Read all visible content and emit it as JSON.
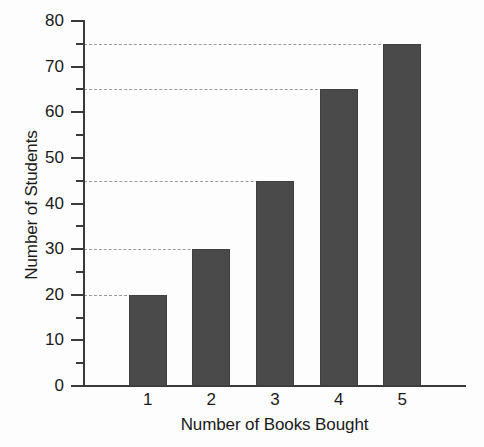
{
  "chart_data": {
    "type": "bar",
    "title": "",
    "xlabel": "Number of Books Bought",
    "ylabel": "Number of Students",
    "categories": [
      "1",
      "2",
      "3",
      "4",
      "5"
    ],
    "values": [
      20,
      30,
      45,
      65,
      75
    ],
    "ylim": [
      0,
      80
    ],
    "xlim": [
      0,
      6
    ],
    "y_major_ticks": [
      0,
      10,
      20,
      30,
      40,
      50,
      60,
      70,
      80
    ],
    "y_minor_ticks": [
      5,
      15,
      25,
      35,
      45,
      55,
      65,
      75
    ],
    "y_tick_labels": [
      "0",
      "10",
      "20",
      "30",
      "40",
      "50",
      "60",
      "70",
      "80"
    ],
    "gridlines": [
      20,
      30,
      45,
      65,
      75
    ],
    "grid": "dashed-horizontal-to-bar",
    "legend": null,
    "legend_position": "none",
    "series": [
      {
        "name": "Students",
        "values": [
          20,
          30,
          45,
          65,
          75
        ],
        "color": "#4a4a4a"
      }
    ],
    "bar_color": "#4a4a4a",
    "bar_edge_color": "#3f3f3f",
    "axis_color": "#3a3a3a",
    "gridline_color": "#9a9a9a",
    "background_color": "#fdfdfd",
    "text_color": "#1a1a1a"
  }
}
